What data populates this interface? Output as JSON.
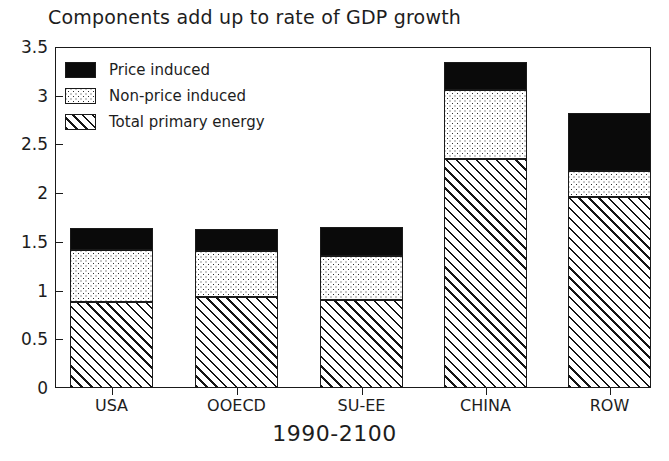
{
  "chart_data": {
    "type": "bar",
    "stacked": true,
    "title": "Components add up to rate of GDP growth",
    "xlabel": "1990-2100",
    "ylabel": "",
    "categories": [
      "USA",
      "OOECD",
      "SU-EE",
      "CHINA",
      "ROW"
    ],
    "series": [
      {
        "name": "Total primary energy",
        "pattern": "diagonal-hatch",
        "values": [
          0.88,
          0.93,
          0.9,
          2.35,
          1.96
        ]
      },
      {
        "name": "Non-price induced",
        "pattern": "dotted-stipple",
        "values": [
          0.54,
          0.48,
          0.45,
          0.71,
          0.27
        ]
      },
      {
        "name": "Price induced",
        "pattern": "solid-black",
        "values": [
          0.22,
          0.22,
          0.3,
          0.29,
          0.59
        ]
      }
    ],
    "totals": [
      1.64,
      1.63,
      1.65,
      3.35,
      2.82
    ],
    "ylim": [
      0,
      3.5
    ],
    "yticks": [
      "0",
      "0.5",
      "1",
      "1.5",
      "2",
      "2.5",
      "3",
      "3.5"
    ],
    "ytick_values": [
      0,
      0.5,
      1,
      1.5,
      2,
      2.5,
      3,
      3.5
    ],
    "grid": false,
    "legend_position": "top-left",
    "legend_entries": [
      {
        "label": "Price induced",
        "pattern": "solid-black"
      },
      {
        "label": "Non-price induced",
        "pattern": "dotted-stipple"
      },
      {
        "label": "Total primary energy",
        "pattern": "diagonal-hatch"
      }
    ],
    "colors": {
      "price_induced": "#0a0a0a",
      "non_price_induced": "#ffffff",
      "total_primary_energy": "#ffffff",
      "axis": "#1a1a1a",
      "background": "#ffffff"
    }
  }
}
